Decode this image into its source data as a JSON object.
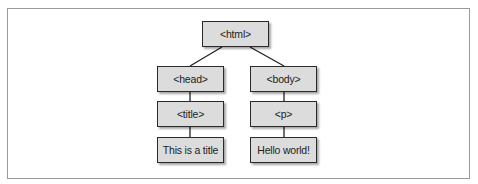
{
  "diagram": {
    "type": "tree",
    "nodes": {
      "html": "<html>",
      "head": "<head>",
      "body": "<body>",
      "title": "<title>",
      "p": "<p>",
      "title_text": "This is a title",
      "p_text": "Hello world!"
    },
    "edges": [
      [
        "html",
        "head"
      ],
      [
        "html",
        "body"
      ],
      [
        "head",
        "title"
      ],
      [
        "body",
        "p"
      ],
      [
        "title",
        "title_text"
      ],
      [
        "p",
        "p_text"
      ]
    ]
  }
}
